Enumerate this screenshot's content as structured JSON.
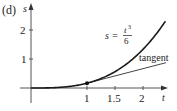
{
  "panel_label": "(d)",
  "axes": {
    "x_label": "t",
    "y_label": "s",
    "x_ticks": [
      "1",
      "1.5",
      "2"
    ],
    "y_ticks": [
      "1",
      "2"
    ]
  },
  "curve": {
    "label_lhs": "s =",
    "label_num": "t",
    "label_exp": "3",
    "label_den": "6",
    "equation": "s = t^3/6"
  },
  "tangent": {
    "label": "tangent",
    "at_t": 1,
    "slope": 0.5
  },
  "colors": {
    "axis": "#444444",
    "curve": "#1a1a1a",
    "tangent": "#444444",
    "text": "#222222"
  }
}
